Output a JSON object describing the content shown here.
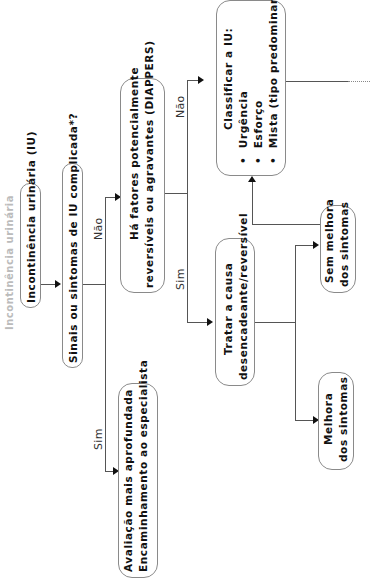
{
  "diagram": {
    "title": "Incontinência urinária",
    "orientation": "rotated-90-ccw",
    "nodes": {
      "start": "Incontinência urinária (IU)",
      "q1": "Sinais ou sintomas de IU complicada*?",
      "specialist": [
        "Avaliação mais aprofundada",
        "Encaminhamento ao especialista"
      ],
      "q2": [
        "Há fatores potencialmente",
        "reversíveis ou agravantes (DIAPPERS)"
      ],
      "treat": [
        "Tratar a causa",
        "desencadeante/reversível"
      ],
      "classify": {
        "title": "Classificar a IU:",
        "items": [
          "Urgência",
          "Esforço",
          "Mista (tipo predominante)"
        ]
      },
      "improve": [
        "Melhora",
        "dos sintomas"
      ],
      "no_improve": [
        "Sem melhora",
        "dos sintomas"
      ]
    },
    "edge_labels": {
      "q1_yes": "Sim",
      "q1_no": "Não",
      "q2_yes": "Sim",
      "q2_no": "Não"
    },
    "colors": {
      "box_border": "#8a8a8a",
      "line": "#555555",
      "text": "#111111"
    }
  }
}
